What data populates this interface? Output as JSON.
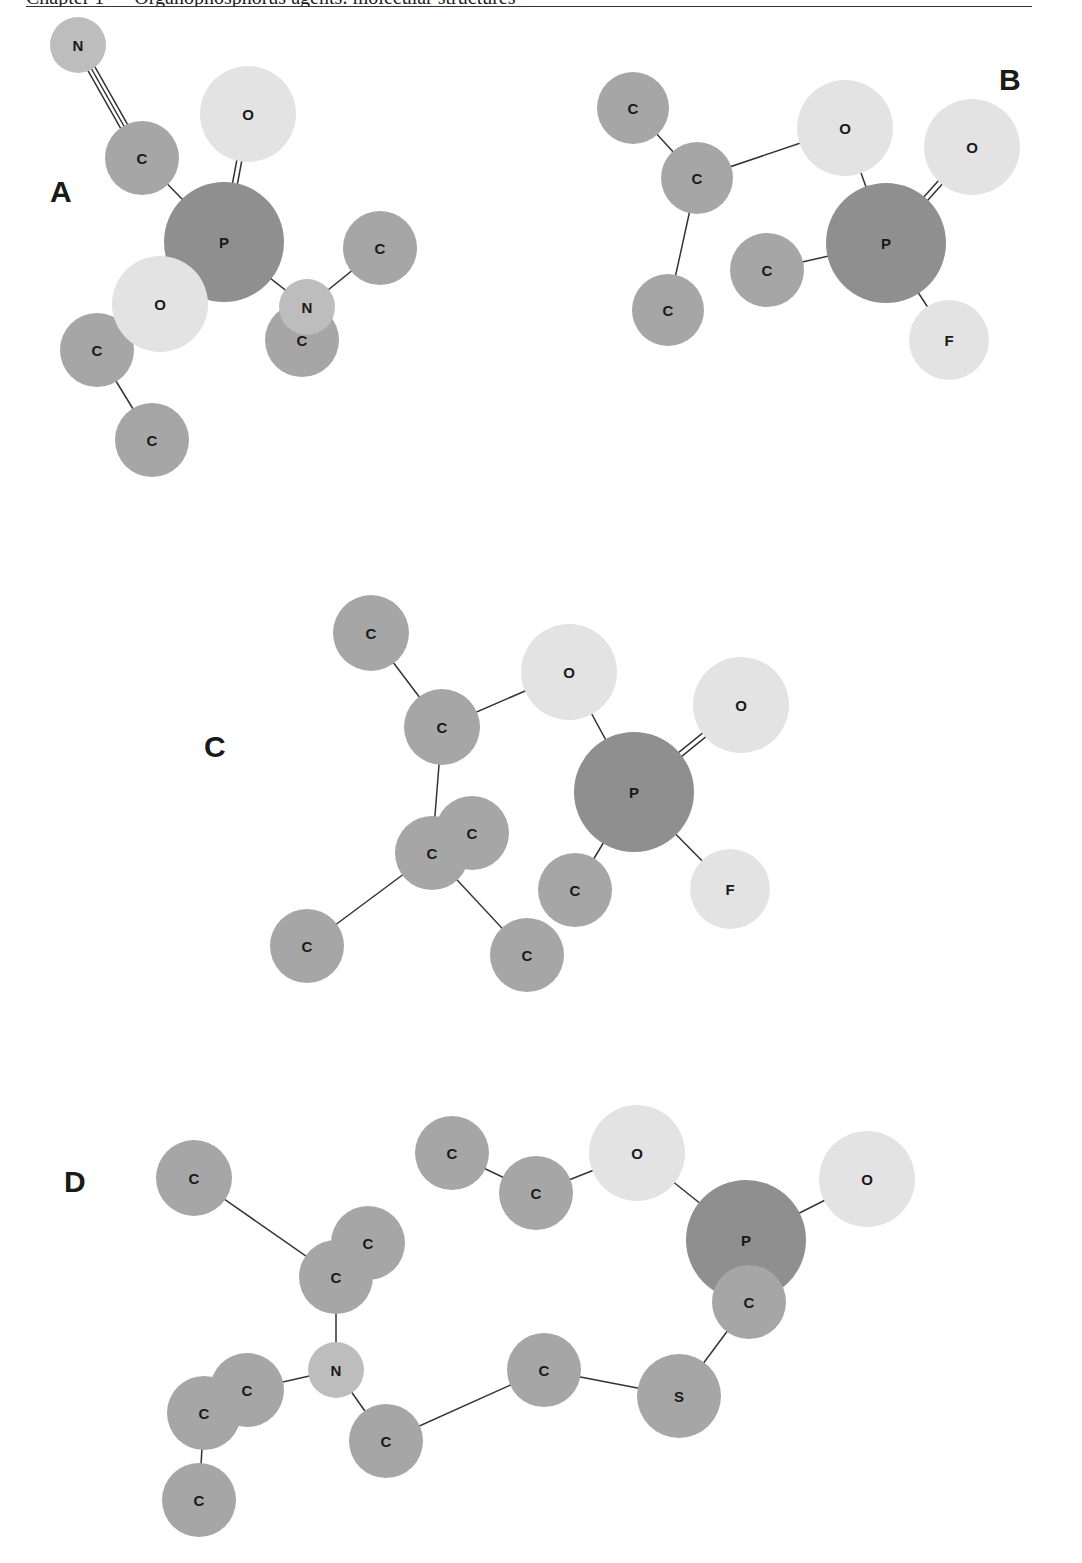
{
  "header": {
    "running_head": "Chapter 1 — Organophosphorus agents: molecular structures"
  },
  "atom_colors": {
    "P": "#8f8f8f",
    "C": "#a6a6a6",
    "N": "#bdbdbd",
    "S": "#a6a6a6",
    "O": "#e3e3e3",
    "F": "#e3e3e3"
  },
  "panels": [
    {
      "label": "A",
      "label_pos": [
        50,
        202
      ],
      "atoms": [
        {
          "el": "N",
          "x": 78,
          "y": 45,
          "r": 28
        },
        {
          "el": "C",
          "x": 142,
          "y": 158,
          "r": 37
        },
        {
          "el": "O",
          "x": 248,
          "y": 114,
          "r": 48
        },
        {
          "el": "C",
          "x": 380,
          "y": 248,
          "r": 37
        },
        {
          "el": "P",
          "x": 224,
          "y": 242,
          "r": 60
        },
        {
          "el": "C",
          "x": 97,
          "y": 350,
          "r": 37
        },
        {
          "el": "C",
          "x": 152,
          "y": 440,
          "r": 37
        },
        {
          "el": "O",
          "x": 160,
          "y": 304,
          "r": 48
        },
        {
          "el": "C",
          "x": 302,
          "y": 340,
          "r": 37
        },
        {
          "el": "N",
          "x": 307,
          "y": 307,
          "r": 28
        }
      ],
      "bonds": [
        {
          "a": 0,
          "b": 1,
          "order": 3
        },
        {
          "a": 1,
          "b": 4,
          "order": 1
        },
        {
          "a": 2,
          "b": 4,
          "order": 2
        },
        {
          "a": 4,
          "b": 9,
          "order": 1
        },
        {
          "a": 9,
          "b": 3,
          "order": 1
        },
        {
          "a": 7,
          "b": 5,
          "order": 1
        },
        {
          "a": 5,
          "b": 6,
          "order": 1
        }
      ]
    },
    {
      "label": "B",
      "label_pos": [
        999,
        90
      ],
      "atoms": [
        {
          "el": "C",
          "x": 633,
          "y": 108,
          "r": 36
        },
        {
          "el": "C",
          "x": 697,
          "y": 178,
          "r": 36
        },
        {
          "el": "O",
          "x": 845,
          "y": 128,
          "r": 48
        },
        {
          "el": "O",
          "x": 972,
          "y": 147,
          "r": 48
        },
        {
          "el": "P",
          "x": 886,
          "y": 243,
          "r": 60
        },
        {
          "el": "C",
          "x": 767,
          "y": 270,
          "r": 37
        },
        {
          "el": "C",
          "x": 668,
          "y": 310,
          "r": 36
        },
        {
          "el": "F",
          "x": 949,
          "y": 340,
          "r": 40
        }
      ],
      "bonds": [
        {
          "a": 0,
          "b": 1,
          "order": 1
        },
        {
          "a": 1,
          "b": 2,
          "order": 1
        },
        {
          "a": 1,
          "b": 6,
          "order": 1
        },
        {
          "a": 2,
          "b": 4,
          "order": 1
        },
        {
          "a": 4,
          "b": 3,
          "order": 2
        },
        {
          "a": 4,
          "b": 5,
          "order": 1
        },
        {
          "a": 4,
          "b": 7,
          "order": 1
        }
      ]
    },
    {
      "label": "C",
      "label_pos": [
        204,
        757
      ],
      "atoms": [
        {
          "el": "C",
          "x": 371,
          "y": 633,
          "r": 38
        },
        {
          "el": "C",
          "x": 442,
          "y": 727,
          "r": 38
        },
        {
          "el": "O",
          "x": 569,
          "y": 672,
          "r": 48
        },
        {
          "el": "O",
          "x": 741,
          "y": 705,
          "r": 48
        },
        {
          "el": "P",
          "x": 634,
          "y": 792,
          "r": 60
        },
        {
          "el": "C",
          "x": 472,
          "y": 833,
          "r": 37
        },
        {
          "el": "C",
          "x": 432,
          "y": 853,
          "r": 37
        },
        {
          "el": "C",
          "x": 575,
          "y": 890,
          "r": 37
        },
        {
          "el": "F",
          "x": 730,
          "y": 889,
          "r": 40
        },
        {
          "el": "C",
          "x": 307,
          "y": 946,
          "r": 37
        },
        {
          "el": "C",
          "x": 527,
          "y": 955,
          "r": 37
        }
      ],
      "bonds": [
        {
          "a": 0,
          "b": 1,
          "order": 1
        },
        {
          "a": 1,
          "b": 2,
          "order": 1
        },
        {
          "a": 2,
          "b": 4,
          "order": 1
        },
        {
          "a": 4,
          "b": 3,
          "order": 2
        },
        {
          "a": 4,
          "b": 8,
          "order": 1
        },
        {
          "a": 4,
          "b": 7,
          "order": 1
        },
        {
          "a": 1,
          "b": 6,
          "order": 1
        },
        {
          "a": 6,
          "b": 9,
          "order": 1
        },
        {
          "a": 6,
          "b": 10,
          "order": 1
        }
      ]
    },
    {
      "label": "D",
      "label_pos": [
        64,
        1192
      ],
      "atoms": [
        {
          "el": "C",
          "x": 194,
          "y": 1178,
          "r": 38
        },
        {
          "el": "C",
          "x": 452,
          "y": 1153,
          "r": 37
        },
        {
          "el": "C",
          "x": 536,
          "y": 1193,
          "r": 37
        },
        {
          "el": "O",
          "x": 637,
          "y": 1153,
          "r": 48
        },
        {
          "el": "O",
          "x": 867,
          "y": 1179,
          "r": 48
        },
        {
          "el": "C",
          "x": 368,
          "y": 1243,
          "r": 37
        },
        {
          "el": "C",
          "x": 336,
          "y": 1277,
          "r": 37
        },
        {
          "el": "P",
          "x": 746,
          "y": 1240,
          "r": 60
        },
        {
          "el": "C",
          "x": 749,
          "y": 1302,
          "r": 37
        },
        {
          "el": "N",
          "x": 336,
          "y": 1370,
          "r": 28
        },
        {
          "el": "C",
          "x": 247,
          "y": 1390,
          "r": 37
        },
        {
          "el": "C",
          "x": 204,
          "y": 1413,
          "r": 37
        },
        {
          "el": "C",
          "x": 544,
          "y": 1370,
          "r": 37
        },
        {
          "el": "S",
          "x": 679,
          "y": 1396,
          "r": 42
        },
        {
          "el": "C",
          "x": 386,
          "y": 1441,
          "r": 37
        },
        {
          "el": "C",
          "x": 199,
          "y": 1500,
          "r": 37
        }
      ],
      "bonds": [
        {
          "a": 0,
          "b": 6,
          "order": 1
        },
        {
          "a": 1,
          "b": 2,
          "order": 1
        },
        {
          "a": 2,
          "b": 3,
          "order": 1
        },
        {
          "a": 3,
          "b": 7,
          "order": 1
        },
        {
          "a": 7,
          "b": 4,
          "order": 1
        },
        {
          "a": 8,
          "b": 13,
          "order": 1
        },
        {
          "a": 13,
          "b": 12,
          "order": 1
        },
        {
          "a": 12,
          "b": 14,
          "order": 1
        },
        {
          "a": 14,
          "b": 9,
          "order": 1
        },
        {
          "a": 9,
          "b": 6,
          "order": 1
        },
        {
          "a": 9,
          "b": 10,
          "order": 1
        },
        {
          "a": 11,
          "b": 15,
          "order": 1
        }
      ]
    }
  ]
}
